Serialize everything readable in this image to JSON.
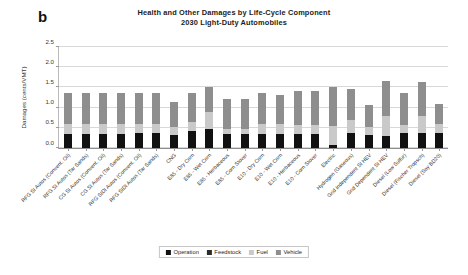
{
  "panel_label": "b",
  "title_lines": [
    "Health and Other Damages by Life-Cycle Component",
    "2030 Light-Duty Automobiles"
  ],
  "colors": {
    "operation": "#111111",
    "feedstock": "#2b2b2b",
    "fuel": "#c9c9c9",
    "vehicle": "#8e8e8e",
    "gridline": "#d8d8d8",
    "axis": "#8d8d8d",
    "text": "#2e2e2e"
  },
  "legend": {
    "position": "bottom",
    "items": [
      {
        "label": "Operation",
        "color": "#111111"
      },
      {
        "label": "Feedstock",
        "color": "#2b2b2b"
      },
      {
        "label": "Fuel",
        "color": "#c9c9c9"
      },
      {
        "label": "Vehicle",
        "color": "#8e8e8e"
      }
    ]
  },
  "chart_data": {
    "type": "bar",
    "subtype": "stacked",
    "title": "Health and Other Damages by Life-Cycle Component 2030 Light-Duty Automobiles",
    "xlabel": "",
    "ylabel": "Damages (cents/VMT)",
    "ylim": [
      0.0,
      2.5
    ],
    "yticks": [
      0.0,
      0.5,
      1.0,
      1.5,
      2.0,
      2.5
    ],
    "ytick_labels": [
      "0.0",
      "0.5",
      "1.0",
      "1.5",
      "2.0",
      "2.5"
    ],
    "grid": true,
    "legend_position": "bottom",
    "categories": [
      "RFG SI Autos (Convent. Oil)",
      "RFG SI Autos (Tar Sands)",
      "CG SI Autos (Convent. Oil)",
      "CG SI Autos (Tar Sands)",
      "RFG SIDI Autos (Convent. Oil)",
      "RFG SIDI Autos (Tar Sands)",
      "CNG",
      "E85 - Dry Corn",
      "E85 - Wet Corn",
      "E85 - Herbaceous",
      "E85 - Corn Stover",
      "E10 - Dry Corn",
      "E10 - Wet Corn",
      "E10 - Herbaceous",
      "E10 - Corn Stover",
      "Electric",
      "Hydrogen (Gaseous)",
      "Grid Independent SI HEV",
      "Grid Dependent SI HEV",
      "Diesel (Low Sulfur)",
      "Diesel (Fischer Tropsch)",
      "Diesel (Soy BD20)"
    ],
    "series": [
      {
        "name": "Operation",
        "color": "#111111",
        "values": [
          0.34,
          0.34,
          0.34,
          0.34,
          0.37,
          0.37,
          0.31,
          0.41,
          0.47,
          0.34,
          0.34,
          0.35,
          0.35,
          0.35,
          0.35,
          0.07,
          0.37,
          0.33,
          0.3,
          0.38,
          0.36,
          0.36
        ]
      },
      {
        "name": "Feedstock",
        "color": "#2b2b2b",
        "values": [
          0.0,
          0.0,
          0.0,
          0.0,
          0.0,
          0.0,
          0.0,
          0.0,
          0.0,
          0.0,
          0.0,
          0.0,
          0.0,
          0.0,
          0.0,
          0.0,
          0.0,
          0.0,
          0.0,
          0.0,
          0.0,
          0.0
        ]
      },
      {
        "name": "Fuel",
        "color": "#c9c9c9",
        "values": [
          0.25,
          0.25,
          0.25,
          0.25,
          0.22,
          0.22,
          0.2,
          0.23,
          0.41,
          0.14,
          0.14,
          0.25,
          0.25,
          0.22,
          0.22,
          0.47,
          0.32,
          0.2,
          0.5,
          0.18,
          0.43,
          0.24
        ]
      },
      {
        "name": "Vehicle",
        "color": "#8e8e8e",
        "values": [
          0.76,
          0.76,
          0.76,
          0.76,
          0.77,
          0.77,
          0.64,
          0.72,
          0.64,
          0.73,
          0.73,
          0.76,
          0.71,
          0.84,
          0.84,
          0.98,
          0.78,
          0.53,
          0.85,
          0.8,
          0.85,
          0.5
        ]
      }
    ],
    "totals": [
      1.35,
      1.35,
      1.35,
      1.35,
      1.36,
      1.36,
      1.15,
      1.36,
      1.52,
      1.21,
      1.21,
      1.36,
      1.31,
      1.41,
      1.41,
      1.52,
      1.47,
      1.06,
      1.65,
      1.36,
      1.64,
      1.1
    ]
  }
}
